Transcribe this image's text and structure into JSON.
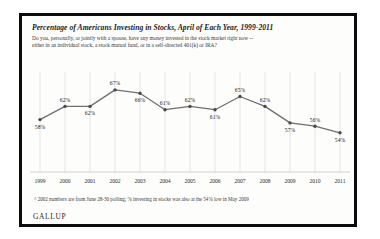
{
  "frame": {
    "logo": "GALLUP"
  },
  "header": {
    "title": "Percentage of Americans Investing in Stocks, April of Each Year, 1999-2011",
    "subtitle_line1": "Do you, personally, or jointly with a spouse, have any money invested in the stock market right now --",
    "subtitle_line2": "either in an individual stock, a stock mutual fund, or in a self-directed 401(k) or IRA?"
  },
  "footnote": "^ 2002 numbers are from June 28-30 polling; % investing in stocks was also at the 54% low in May 2009",
  "colors": {
    "line": "#6f6f6f",
    "marker": "#4a4a4a",
    "grid": "#d7d7d7",
    "axis": "#bdbdbd",
    "frame": "#0c0c0c",
    "text": "#1b1b1b",
    "background": "#fdfdfb"
  },
  "chart_data": {
    "type": "line",
    "title": "Percentage of Americans Investing in Stocks, April of Each Year, 1999-2011",
    "xlabel": "",
    "ylabel": "",
    "ylim": [
      50,
      70
    ],
    "grid": true,
    "legend": false,
    "categories": [
      "1999",
      "2000",
      "2001",
      "2002",
      "2003",
      "2004",
      "2005",
      "2006",
      "2007",
      "2008",
      "2009",
      "2010",
      "2011"
    ],
    "values": [
      58,
      62,
      62,
      67,
      66,
      61,
      62,
      61,
      65,
      62,
      57,
      56,
      54
    ],
    "labels": [
      "58%",
      "62%",
      "62%",
      "67%",
      "66%",
      "61%",
      "62%",
      "61%",
      "65%",
      "62%",
      "57%",
      "56%",
      "54%"
    ],
    "label_positions": [
      "below",
      "above",
      "below",
      "above",
      "below",
      "above",
      "above",
      "below",
      "above",
      "above",
      "below",
      "above",
      "below"
    ]
  }
}
